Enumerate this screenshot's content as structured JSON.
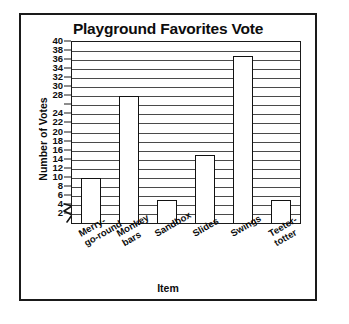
{
  "chart_data": {
    "type": "bar",
    "title": "Playground Favorites Vote",
    "xlabel": "Item",
    "ylabel": "Number of Votes",
    "categories": [
      "Merry-go-round",
      "Monkey bars",
      "Sandbox",
      "Slides",
      "Swings",
      "Teeter-totter"
    ],
    "category_lines": [
      [
        "Merry-",
        "go-round"
      ],
      [
        "Monkey",
        "bars"
      ],
      [
        "Sandbox"
      ],
      [
        "Slides"
      ],
      [
        "Swings"
      ],
      [
        "Teeter-",
        "totter"
      ]
    ],
    "values": [
      10,
      28,
      5,
      15,
      37,
      5
    ],
    "ylim": [
      0,
      40
    ],
    "ytick_values": [
      2,
      4,
      6,
      8,
      10,
      12,
      14,
      16,
      18,
      20,
      22,
      24,
      26,
      28,
      30,
      32,
      34,
      36,
      38,
      40
    ],
    "ytick_labels": [
      "2",
      "4",
      "6",
      "8",
      "10",
      "12",
      "14",
      "16",
      "18",
      "20",
      "22",
      "24",
      "",
      "28",
      "30",
      "32",
      "34",
      "36",
      "38",
      "40"
    ],
    "grid": true,
    "grid_axis": "y",
    "legend": false,
    "axis_break": true,
    "bar_fill": "#ffffff",
    "bar_outline": "#121212",
    "grid_color": "#4a4a4a",
    "text_color": "#0d0d0d"
  }
}
